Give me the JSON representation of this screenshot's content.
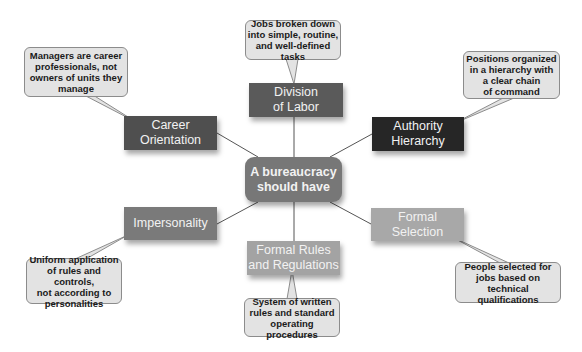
{
  "diagram": {
    "center": {
      "label": "A bureaucracy\nshould have",
      "color": "#777777"
    },
    "nodes": [
      {
        "id": "division",
        "label": "Division\nof Labor",
        "color": "#5a5a5a",
        "callout": "Jobs broken down\ninto simple, routine,\nand well-defined tasks"
      },
      {
        "id": "career",
        "label": "Career\nOrientation",
        "color": "#4f4f4f",
        "callout": "Managers are career\nprofessionals, not\nowners of units they\nmanage"
      },
      {
        "id": "authority",
        "label": "Authority\nHierarchy",
        "color": "#262626",
        "callout": "Positions organized\nin a hierarchy with\na clear chain\nof command"
      },
      {
        "id": "impersonality",
        "label": "Impersonality",
        "color": "#7a7a7a",
        "callout": "Uniform application\nof rules and controls,\nnot according to\npersonalities"
      },
      {
        "id": "rules",
        "label": "Formal Rules\nand Regulations",
        "color": "#a3a3a3",
        "callout": "System of written\nrules and standard\noperating procedures"
      },
      {
        "id": "selection",
        "label": "Formal\nSelection",
        "color": "#a8a8a8",
        "callout": "People selected for\njobs based on\ntechnical qualifications"
      }
    ]
  }
}
